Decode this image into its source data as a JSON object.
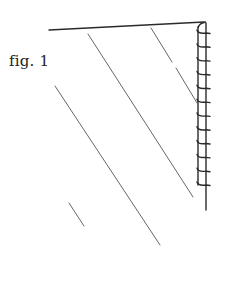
{
  "figure": {
    "label": "fig. 1",
    "colors": {
      "ink": "#2a2a2a",
      "thin_line": "#555555",
      "background": "#ffffff"
    },
    "elements": {
      "top_bar": {
        "from": [
          49,
          30
        ],
        "to": [
          204,
          22
        ]
      },
      "diagonals": [
        {
          "name": "left-diagonal",
          "from": [
            55,
            86
          ],
          "to": [
            160,
            245
          ]
        },
        {
          "name": "middle-diagonal",
          "from": [
            88,
            34
          ],
          "to": [
            193,
            197
          ]
        },
        {
          "name": "right-diagonal-upper",
          "from": [
            151,
            28
          ],
          "to": [
            172,
            62
          ]
        },
        {
          "name": "right-diagonal-lower",
          "from": [
            176,
            68
          ],
          "to": [
            197,
            103
          ]
        },
        {
          "name": "short-dash",
          "from": [
            69,
            203
          ],
          "to": [
            84,
            226
          ]
        }
      ],
      "coil": {
        "x_left": 198,
        "x_right": 206,
        "top": 23,
        "bottom": 185,
        "turns": 12
      },
      "vertical_post": {
        "x": 206,
        "from_y": 23,
        "to_y": 210
      }
    }
  }
}
